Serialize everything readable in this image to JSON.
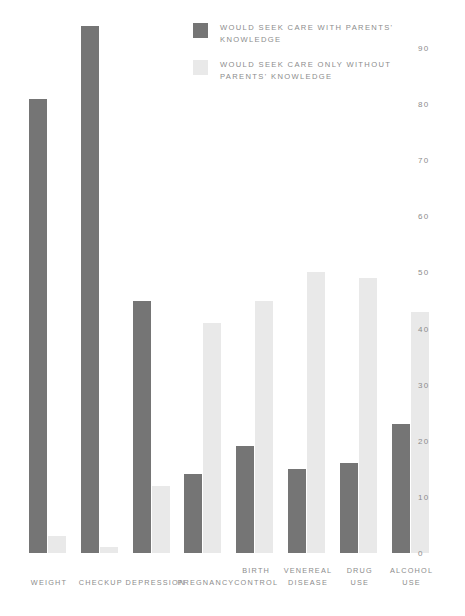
{
  "legend": {
    "position": "top-center",
    "entries": [
      {
        "label": "WOULD SEEK CARE WITH PARENTS'\nKNOWLEDGE",
        "color": "#757575",
        "swatch_name": "legend-swatch-with-parents"
      },
      {
        "label": "WOULD SEEK CARE ONLY WITHOUT\nPARENTS' KNOWLEDGE",
        "color": "#e9e9e9",
        "swatch_name": "legend-swatch-without-parents"
      }
    ]
  },
  "axis": {
    "yticks": [
      "90",
      "80",
      "70",
      "60",
      "50",
      "40",
      "30",
      "20",
      "10",
      "0"
    ],
    "ytick_values": [
      90,
      80,
      70,
      60,
      50,
      40,
      30,
      20,
      10,
      0
    ]
  },
  "chart_data": {
    "type": "bar",
    "title": "",
    "subtitle": "",
    "xlabel": "",
    "ylabel": "",
    "ylim": [
      0,
      90
    ],
    "grid": false,
    "legend_position": "top-center",
    "categories": [
      "WEIGHT",
      "CHECKUP",
      "DEPRESSION",
      "PREGNANCY",
      "BIRTH\nCONTROL",
      "VENEREAL\nDISEASE",
      "DRUG\nUSE",
      "ALCOHOL\nUSE"
    ],
    "series": [
      {
        "name": "WOULD SEEK CARE WITH PARENTS' KNOWLEDGE",
        "color": "#757575",
        "values": [
          81,
          94,
          45,
          14,
          19,
          15,
          16,
          23
        ]
      },
      {
        "name": "WOULD SEEK CARE ONLY WITHOUT PARENTS' KNOWLEDGE",
        "color": "#e9e9e9",
        "values": [
          3,
          1,
          12,
          41,
          45,
          50,
          49,
          43
        ]
      }
    ],
    "annotations": []
  },
  "caption": ""
}
